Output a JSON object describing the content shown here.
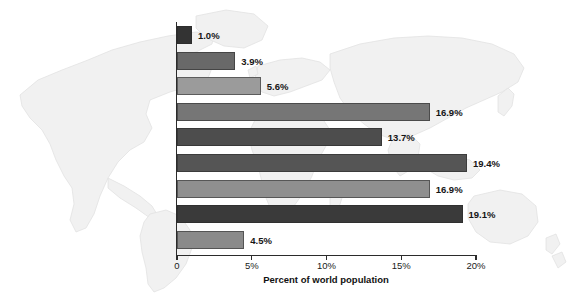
{
  "chart_data": {
    "type": "bar",
    "orientation": "horizontal",
    "title": "",
    "xlabel": "Percent of world population",
    "ylabel": "",
    "xlim": [
      0,
      20
    ],
    "xticks": [
      {
        "value": 0,
        "label": "0"
      },
      {
        "value": 5,
        "label": "5%"
      },
      {
        "value": 10,
        "label": "10%"
      },
      {
        "value": 15,
        "label": "15%"
      },
      {
        "value": 20,
        "label": "20%"
      }
    ],
    "grid": false,
    "legend": null,
    "background": "faint-world-map-watermark",
    "categories": [
      "Jewish",
      "Confucian",
      "Buddhist",
      "Protestant",
      "Hindu",
      "Muslim (Islamic)",
      "Roman Catholic",
      "Nonreligious/Atheistic",
      "Other"
    ],
    "values": [
      1.0,
      3.9,
      5.6,
      16.9,
      13.7,
      19.4,
      16.9,
      19.1,
      4.5
    ],
    "value_labels": [
      "1.0%",
      "3.9%",
      "5.6%",
      "16.9%",
      "13.7%",
      "19.4%",
      "16.9%",
      "19.1%",
      "4.5%"
    ],
    "bar_colors": [
      "#333333",
      "#696969",
      "#9b9b9b",
      "#767676",
      "#4d4d4d",
      "#555555",
      "#8f8f8f",
      "#3a3a3a",
      "#8a8a8a"
    ],
    "bars": [
      {
        "category": "Jewish",
        "value": 1.0,
        "label": "1.0%",
        "color": "#333333"
      },
      {
        "category": "Confucian",
        "value": 3.9,
        "label": "3.9%",
        "color": "#696969"
      },
      {
        "category": "Buddhist",
        "value": 5.6,
        "label": "5.6%",
        "color": "#9b9b9b"
      },
      {
        "category": "Protestant",
        "value": 16.9,
        "label": "16.9%",
        "color": "#767676"
      },
      {
        "category": "Hindu",
        "value": 13.7,
        "label": "13.7%",
        "color": "#4d4d4d"
      },
      {
        "category": "Muslim (Islamic)",
        "value": 19.4,
        "label": "19.4%",
        "color": "#555555"
      },
      {
        "category": "Roman Catholic",
        "value": 16.9,
        "label": "16.9%",
        "color": "#8f8f8f"
      },
      {
        "category": "Nonreligious/Atheistic",
        "value": 19.1,
        "label": "19.1%",
        "color": "#3a3a3a"
      },
      {
        "category": "Other",
        "value": 4.5,
        "label": "4.5%",
        "color": "#8a8a8a"
      }
    ],
    "axis_color": "#2b2b2b"
  }
}
